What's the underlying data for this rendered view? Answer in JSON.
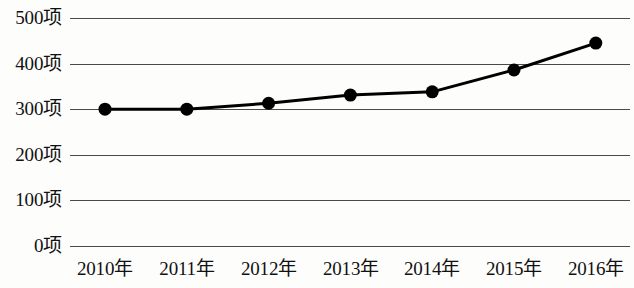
{
  "chart_data": {
    "type": "line",
    "title": "",
    "subtitle": "",
    "xlabel": "",
    "ylabel": "",
    "categories": [
      "2010年",
      "2011年",
      "2012年",
      "2013年",
      "2014年",
      "2015年",
      "2016年"
    ],
    "values": [
      300,
      300,
      313,
      331,
      338,
      386,
      445
    ],
    "series": [
      {
        "name": "",
        "values": [
          300,
          300,
          313,
          331,
          338,
          386,
          445
        ]
      }
    ],
    "ylim": [
      0,
      500
    ],
    "y_ticks": [
      0,
      100,
      200,
      300,
      400,
      500
    ],
    "y_tick_labels": [
      "0项",
      "100项",
      "200项",
      "300项",
      "400项",
      "500项"
    ],
    "x_tick_labels": [
      "2010年",
      "2011年",
      "2012年",
      "2013年",
      "2014年",
      "2015年",
      "2016年"
    ],
    "unit_suffix": "项",
    "grid": true,
    "grid_axis": "y",
    "legend": false,
    "legend_position": "none",
    "marker": "circle",
    "marker_size": 13,
    "line_color": "#000000",
    "marker_color": "#000000",
    "grid_color": "#4a4a4a",
    "background_color": "#fdfdfc",
    "text_color": "#111111",
    "annotations": []
  }
}
